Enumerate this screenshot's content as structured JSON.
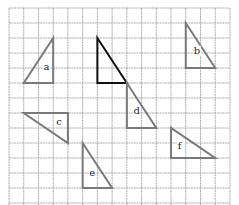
{
  "diagram": {
    "title": "",
    "grid": {
      "origin_x": 9,
      "origin_y": 8,
      "cell_w": 14.73,
      "cell_h": 15,
      "cols": 15,
      "rows": 13,
      "line_color": "#9a9a9a"
    },
    "original": {
      "name": "original-triangle",
      "color": "#111111",
      "points": [
        [
          6,
          2
        ],
        [
          6,
          5
        ],
        [
          8,
          5
        ]
      ]
    },
    "triangles": [
      {
        "label": "a",
        "color": "#7a7a7a",
        "points": [
          [
            3,
            2
          ],
          [
            1,
            5
          ],
          [
            3,
            5
          ]
        ],
        "label_pos": [
          2.35,
          4.1
        ]
      },
      {
        "label": "b",
        "color": "#7a7a7a",
        "points": [
          [
            12,
            1
          ],
          [
            12,
            4
          ],
          [
            14,
            4
          ]
        ],
        "label_pos": [
          12.55,
          3.05
        ]
      },
      {
        "label": "c",
        "color": "#7a7a7a",
        "points": [
          [
            1,
            7
          ],
          [
            4,
            7
          ],
          [
            4,
            9
          ]
        ],
        "label_pos": [
          3.2,
          7.8
        ]
      },
      {
        "label": "d",
        "color": "#7a7a7a",
        "points": [
          [
            8,
            5
          ],
          [
            8,
            8
          ],
          [
            10,
            8
          ]
        ],
        "label_pos": [
          8.45,
          7.05
        ]
      },
      {
        "label": "e",
        "color": "#7a7a7a",
        "points": [
          [
            5,
            9
          ],
          [
            5,
            12
          ],
          [
            7,
            12
          ]
        ],
        "label_pos": [
          5.45,
          11.2
        ]
      },
      {
        "label": "f",
        "color": "#7a7a7a",
        "points": [
          [
            11,
            8
          ],
          [
            11,
            10
          ],
          [
            14,
            10
          ]
        ],
        "label_pos": [
          11.45,
          9.4
        ]
      }
    ]
  }
}
